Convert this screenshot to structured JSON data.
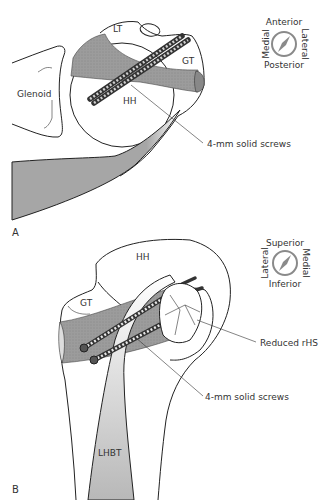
{
  "figure": {
    "panels": [
      {
        "id": "A",
        "label": "A",
        "structures": {
          "glenoid": "Glenoid",
          "humeral_head": "HH",
          "lesser_tuberosity": "LT",
          "greater_tuberosity": "GT"
        },
        "callouts": {
          "screws": "4-mm solid screws"
        },
        "compass": {
          "top": "Anterior",
          "bottom": "Posterior",
          "left": "Medial",
          "right": "Lateral"
        }
      },
      {
        "id": "B",
        "label": "B",
        "structures": {
          "humeral_head": "HH",
          "greater_tuberosity": "GT",
          "biceps_tendon": "LHBT"
        },
        "callouts": {
          "reduced": "Reduced rHS",
          "screws": "4-mm solid screws"
        },
        "compass": {
          "top": "Superior",
          "bottom": "Inferior",
          "left": "Lateral",
          "right": "Medial"
        }
      }
    ],
    "colors": {
      "graft_gray": "#9a9a9a",
      "muscle_gray": "#a6a6a6",
      "outline": "#222222",
      "compass": "#8a8a8a",
      "text": "#333333"
    }
  }
}
